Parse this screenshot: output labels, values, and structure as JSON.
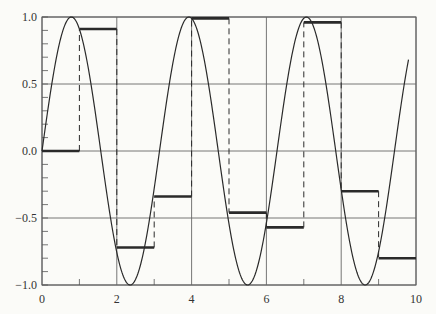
{
  "chart_data": {
    "type": "line",
    "title": "",
    "xlabel": "",
    "ylabel": "",
    "xlim": [
      0,
      10
    ],
    "ylim": [
      -1.0,
      1.0
    ],
    "grid": true,
    "x_ticks": [
      0,
      2,
      4,
      6,
      8,
      10
    ],
    "x_tick_labels": [
      "0",
      "2",
      "4",
      "6",
      "8",
      "10"
    ],
    "y_ticks": [
      1.0,
      0.5,
      0.0,
      -0.5,
      -1.0
    ],
    "y_tick_labels": [
      "1.0",
      "0.5",
      "0.0",
      "−0.5",
      "−1.0"
    ],
    "legend": [],
    "series": [
      {
        "name": "continuous signal",
        "style": "thin solid curve",
        "function": "sin(2t)",
        "x_range": [
          0,
          9.8
        ]
      },
      {
        "name": "sample-and-hold",
        "style": "thick solid steps with dashed vertical transitions",
        "x": [
          0,
          1,
          2,
          3,
          4,
          5,
          6,
          7,
          8,
          9
        ],
        "values": [
          0.0,
          0.91,
          -0.72,
          -0.34,
          0.99,
          -0.46,
          -0.57,
          0.96,
          -0.3,
          -0.8
        ]
      }
    ]
  },
  "colors": {
    "background": "#fbfbf8",
    "axis": "#555555",
    "grid": "#666666",
    "curve": "#2a2a2a",
    "steps": "#2a2a2a"
  }
}
